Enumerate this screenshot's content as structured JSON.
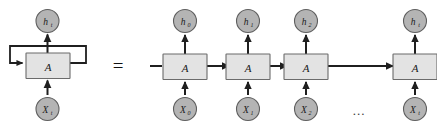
{
  "figure": {
    "equals_sign": "=",
    "ellipsis": "...",
    "colors": {
      "cell_fill": "#e3e3e3",
      "cell_stroke": "#6b6b6b",
      "node_fill": "#b4b4b4",
      "node_stroke": "#5e5e5e",
      "edge": "#1f1f1f",
      "background": "#ffffff"
    }
  },
  "folded": {
    "cell_label": "A",
    "output_label": "h",
    "output_sub": "t",
    "input_label": "X",
    "input_sub": "t",
    "loop_label": ""
  },
  "unrolled": {
    "cell_label": "A",
    "steps": [
      {
        "output_label": "h",
        "output_sub": "0",
        "input_label": "X",
        "input_sub": "0",
        "cell_label": "A"
      },
      {
        "output_label": "h",
        "output_sub": "1",
        "input_label": "X",
        "input_sub": "1",
        "cell_label": "A"
      },
      {
        "output_label": "h",
        "output_sub": "2",
        "input_label": "X",
        "input_sub": "2",
        "cell_label": "A"
      },
      {
        "output_label": "h",
        "output_sub": "t",
        "input_label": "X",
        "input_sub": "t",
        "cell_label": "A"
      }
    ]
  }
}
